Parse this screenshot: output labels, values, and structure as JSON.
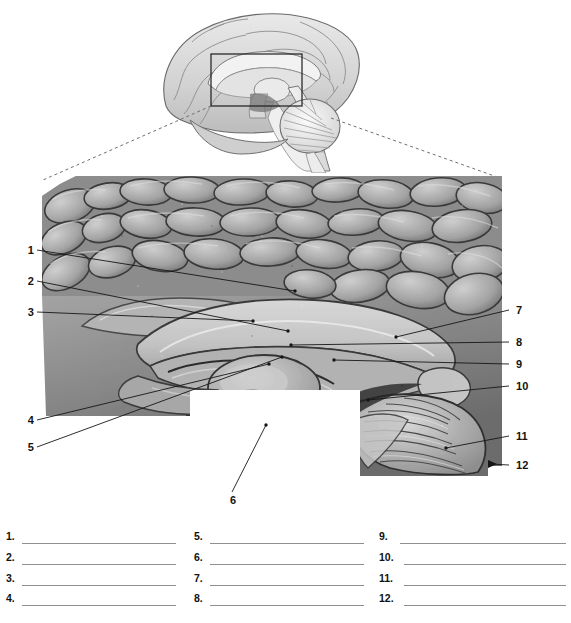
{
  "figure": {
    "key_diagram": {
      "name": "midsagittal-brain-key",
      "inset_box_label": "region-of-interest-box"
    },
    "photograph": {
      "name": "midsagittal-brain-photograph",
      "description": "Grayscale midsagittal section of human brain showing corpus callosum, thalamus, brainstem and cerebellum"
    }
  },
  "callouts": {
    "left": [
      {
        "number": "1",
        "x": 24,
        "y": 245,
        "tip_x": 253,
        "tip_y": 290
      },
      {
        "number": "2",
        "x": 24,
        "y": 276,
        "tip_x": 246,
        "tip_y": 330
      },
      {
        "number": "3",
        "x": 24,
        "y": 307,
        "tip_x": 211,
        "tip_y": 317
      },
      {
        "number": "4",
        "x": 24,
        "y": 416,
        "tip_x": 227,
        "tip_y": 363
      },
      {
        "number": "5",
        "x": 24,
        "y": 443,
        "tip_x": 240,
        "tip_y": 355
      }
    ],
    "right": [
      {
        "number": "7",
        "x": 516,
        "y": 305,
        "tip_x": 393,
        "tip_y": 334
      },
      {
        "number": "8",
        "x": 516,
        "y": 338,
        "tip_x": 289,
        "tip_y": 342
      },
      {
        "number": "9",
        "x": 516,
        "y": 359,
        "tip_x": 331,
        "tip_y": 358
      },
      {
        "number": "10",
        "x": 516,
        "y": 381,
        "tip_x": 365,
        "tip_y": 398
      },
      {
        "number": "11",
        "x": 516,
        "y": 431,
        "tip_x": 443,
        "tip_y": 446
      },
      {
        "number": "12",
        "x": 516,
        "y": 460,
        "tip_x": 487,
        "tip_y": 461
      }
    ],
    "below": [
      {
        "number": "6",
        "x": 227,
        "y": 497,
        "tip_x": 264,
        "tip_y": 424
      }
    ]
  },
  "answer_lines": {
    "columns": [
      {
        "column": 1,
        "items": [
          "1.",
          "2.",
          "3.",
          "4."
        ]
      },
      {
        "column": 2,
        "items": [
          "5.",
          "6.",
          "7.",
          "8."
        ]
      },
      {
        "column": 3,
        "items": [
          "9.",
          "10.",
          "11.",
          "12."
        ]
      }
    ],
    "row_y": [
      530,
      551,
      572,
      592
    ]
  },
  "colors": {
    "rule": "#8d8f92",
    "leader": "#1a1a1a",
    "dashed": "#6f6f6f",
    "text": "#131313",
    "page_bg": "#ffffff"
  },
  "footnote": {
    "text": ""
  }
}
